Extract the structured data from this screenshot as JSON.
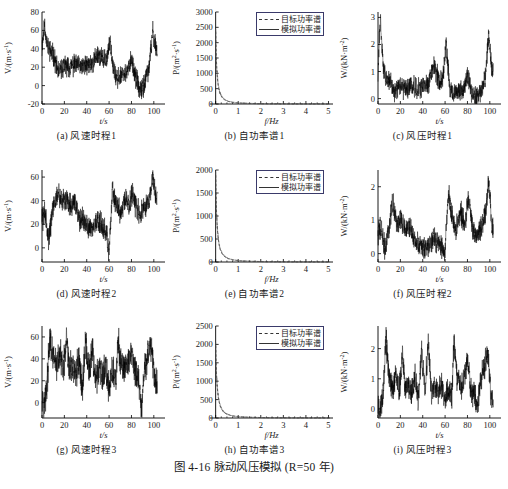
{
  "figure": {
    "caption": "图 4-16  脉动风压模拟 (R=50 年)",
    "caption_number": "图 4-16",
    "caption_title": "脉动风压模拟",
    "caption_note": "R=50 年"
  },
  "legend": {
    "target_label": "目标功率谱",
    "simulated_label": "模拟功率谱",
    "target_style": "dashed",
    "simulated_style": "solid",
    "border_color": "#3a3a6a"
  },
  "colors": {
    "line": "#000000",
    "axis": "#000000",
    "background": "#ffffff"
  },
  "chart_data": [
    {
      "id": "a",
      "type": "line",
      "title": "(a) 风速时程1",
      "xlabel": "t/s",
      "ylabel": "V/(m·s⁻¹)",
      "xlim": [
        0,
        110
      ],
      "ylim": [
        -20,
        80
      ],
      "xticks": [
        0,
        20,
        40,
        60,
        80,
        100
      ],
      "yticks": [
        -20,
        0,
        20,
        40,
        60,
        80
      ],
      "grid": false,
      "legend": false,
      "series": [
        {
          "name": "脉动风速1",
          "seed": 11,
          "mean": 26,
          "amp": 13,
          "noise": 9,
          "envelope": [
            [
              0,
              40
            ],
            [
              2,
              67
            ],
            [
              5,
              42
            ],
            [
              10,
              33
            ],
            [
              15,
              14
            ],
            [
              20,
              22
            ],
            [
              25,
              20
            ],
            [
              30,
              24
            ],
            [
              35,
              20
            ],
            [
              40,
              22
            ],
            [
              45,
              24
            ],
            [
              50,
              34
            ],
            [
              55,
              27
            ],
            [
              58,
              30
            ],
            [
              61,
              48
            ],
            [
              64,
              20
            ],
            [
              67,
              5
            ],
            [
              72,
              14
            ],
            [
              76,
              12
            ],
            [
              80,
              30
            ],
            [
              84,
              8
            ],
            [
              88,
              -8
            ],
            [
              92,
              4
            ],
            [
              96,
              22
            ],
            [
              99,
              58
            ],
            [
              102,
              40
            ]
          ]
        }
      ]
    },
    {
      "id": "b",
      "type": "line",
      "title": "(b) 自功率谱1",
      "xlabel": "f/Hz",
      "ylabel": "P/(m²·s⁻¹)",
      "xlim": [
        -0.25,
        5.2
      ],
      "ylim": [
        0,
        3000
      ],
      "xticks": [
        0,
        1,
        2,
        3,
        4,
        5
      ],
      "yticks": [
        0,
        500,
        1000,
        1500,
        2000,
        2500,
        3000
      ],
      "grid": false,
      "legend": true,
      "peak_value": 2550,
      "series": [
        {
          "name": "目标功率谱",
          "style": "dashed",
          "peak": 2550,
          "decay": 0.085
        },
        {
          "name": "模拟功率谱",
          "style": "solid",
          "peak": 2500,
          "decay": 0.09
        }
      ]
    },
    {
      "id": "c",
      "type": "line",
      "title": "(c) 风压时程1",
      "xlabel": "t/s",
      "ylabel": "W/(kN·m⁻²)",
      "xlim": [
        0,
        110
      ],
      "ylim": [
        -0.2,
        3.2
      ],
      "xticks": [
        0,
        20,
        40,
        60,
        80,
        100
      ],
      "yticks": [
        0,
        1,
        2,
        3
      ],
      "grid": false,
      "legend": false,
      "series": [
        {
          "name": "脉动风压1",
          "seed": 31,
          "mean": 0.55,
          "amp": 0.45,
          "noise": 0.3,
          "envelope": [
            [
              0,
              0.9
            ],
            [
              2,
              2.95
            ],
            [
              5,
              1.0
            ],
            [
              10,
              0.65
            ],
            [
              15,
              0.25
            ],
            [
              20,
              0.45
            ],
            [
              25,
              0.35
            ],
            [
              30,
              0.5
            ],
            [
              35,
              0.35
            ],
            [
              40,
              0.45
            ],
            [
              45,
              0.55
            ],
            [
              50,
              1.25
            ],
            [
              55,
              0.6
            ],
            [
              58,
              0.8
            ],
            [
              61,
              2.1
            ],
            [
              64,
              0.45
            ],
            [
              67,
              0.1
            ],
            [
              72,
              0.3
            ],
            [
              76,
              0.25
            ],
            [
              80,
              0.9
            ],
            [
              84,
              0.2
            ],
            [
              88,
              0.05
            ],
            [
              92,
              0.25
            ],
            [
              96,
              0.8
            ],
            [
              99,
              2.45
            ],
            [
              102,
              1.0
            ]
          ]
        }
      ]
    },
    {
      "id": "d",
      "type": "line",
      "title": "(d) 风速时程2",
      "xlabel": "t/s",
      "ylabel": "V/(m·s⁻¹)",
      "xlim": [
        0,
        110
      ],
      "ylim": [
        -12,
        66
      ],
      "xticks": [
        0,
        20,
        40,
        60,
        80,
        100
      ],
      "yticks": [
        0,
        20,
        40,
        60
      ],
      "grid": false,
      "legend": false,
      "series": [
        {
          "name": "脉动风速2",
          "seed": 57,
          "mean": 28,
          "amp": 11,
          "noise": 8,
          "envelope": [
            [
              0,
              24
            ],
            [
              3,
              30
            ],
            [
              6,
              6
            ],
            [
              10,
              35
            ],
            [
              14,
              46
            ],
            [
              18,
              38
            ],
            [
              22,
              42
            ],
            [
              26,
              36
            ],
            [
              30,
              38
            ],
            [
              34,
              24
            ],
            [
              38,
              22
            ],
            [
              42,
              18
            ],
            [
              46,
              17
            ],
            [
              50,
              24
            ],
            [
              54,
              18
            ],
            [
              58,
              12
            ],
            [
              60,
              -6
            ],
            [
              63,
              52
            ],
            [
              66,
              38
            ],
            [
              70,
              30
            ],
            [
              74,
              40
            ],
            [
              78,
              36
            ],
            [
              81,
              47
            ],
            [
              85,
              32
            ],
            [
              88,
              30
            ],
            [
              92,
              34
            ],
            [
              96,
              40
            ],
            [
              99,
              58
            ],
            [
              102,
              42
            ]
          ]
        }
      ]
    },
    {
      "id": "e",
      "type": "line",
      "title": "(e) 自功率谱2",
      "xlabel": "f/Hz",
      "ylabel": "P/(m²·s⁻¹)",
      "xlim": [
        -0.25,
        5.2
      ],
      "ylim": [
        0,
        2000
      ],
      "xticks": [
        0,
        1,
        2,
        3,
        4,
        5
      ],
      "yticks": [
        0,
        500,
        1000,
        1500,
        2000
      ],
      "grid": false,
      "legend": true,
      "peak_value": 2030,
      "series": [
        {
          "name": "目标功率谱",
          "style": "dashed",
          "peak": 2030,
          "decay": 0.09
        },
        {
          "name": "模拟功率谱",
          "style": "solid",
          "peak": 1980,
          "decay": 0.095
        }
      ]
    },
    {
      "id": "f",
      "type": "line",
      "title": "(f) 风压时程2",
      "xlabel": "t/s",
      "ylabel": "W/(kN·m⁻²)",
      "xlim": [
        0,
        110
      ],
      "ylim": [
        -0.25,
        2.5
      ],
      "xticks": [
        0,
        20,
        40,
        60,
        80,
        100
      ],
      "yticks": [
        0,
        1,
        2
      ],
      "grid": false,
      "legend": false,
      "series": [
        {
          "name": "脉动风压2",
          "seed": 73,
          "mean": 0.6,
          "amp": 0.4,
          "noise": 0.28,
          "envelope": [
            [
              0,
              0.6
            ],
            [
              3,
              0.8
            ],
            [
              6,
              0.1
            ],
            [
              10,
              0.75
            ],
            [
              13,
              1.55
            ],
            [
              17,
              0.85
            ],
            [
              21,
              1.0
            ],
            [
              25,
              0.7
            ],
            [
              29,
              0.75
            ],
            [
              33,
              0.35
            ],
            [
              37,
              0.3
            ],
            [
              41,
              0.18
            ],
            [
              45,
              0.2
            ],
            [
              49,
              0.45
            ],
            [
              53,
              0.35
            ],
            [
              57,
              0.25
            ],
            [
              60,
              0.05
            ],
            [
              63,
              1.9
            ],
            [
              66,
              1.1
            ],
            [
              70,
              0.7
            ],
            [
              74,
              1.2
            ],
            [
              78,
              0.95
            ],
            [
              81,
              1.75
            ],
            [
              85,
              0.65
            ],
            [
              88,
              0.55
            ],
            [
              92,
              0.75
            ],
            [
              96,
              1.1
            ],
            [
              99,
              2.2
            ],
            [
              102,
              0.8
            ]
          ]
        }
      ]
    },
    {
      "id": "g",
      "type": "line",
      "title": "(g) 风速时程3",
      "xlabel": "t/s",
      "ylabel": "V/(m·s⁻¹)",
      "xlim": [
        0,
        110
      ],
      "ylim": [
        -14,
        70
      ],
      "xticks": [
        0,
        20,
        40,
        60,
        80,
        100
      ],
      "yticks": [
        0,
        20,
        40,
        60
      ],
      "grid": false,
      "legend": false,
      "series": [
        {
          "name": "脉动风速3",
          "seed": 97,
          "mean": 30,
          "amp": 16,
          "noise": 12,
          "envelope": [
            [
              0,
              10
            ],
            [
              2,
              -4
            ],
            [
              5,
              24
            ],
            [
              7,
              58
            ],
            [
              10,
              40
            ],
            [
              13,
              34
            ],
            [
              16,
              44
            ],
            [
              19,
              28
            ],
            [
              22,
              56
            ],
            [
              24,
              30
            ],
            [
              27,
              34
            ],
            [
              30,
              26
            ],
            [
              33,
              40
            ],
            [
              36,
              12
            ],
            [
              39,
              56
            ],
            [
              42,
              26
            ],
            [
              45,
              48
            ],
            [
              48,
              20
            ],
            [
              51,
              32
            ],
            [
              54,
              22
            ],
            [
              57,
              34
            ],
            [
              60,
              12
            ],
            [
              63,
              30
            ],
            [
              66,
              20
            ],
            [
              68,
              54
            ],
            [
              71,
              34
            ],
            [
              74,
              30
            ],
            [
              77,
              36
            ],
            [
              80,
              48
            ],
            [
              83,
              28
            ],
            [
              86,
              24
            ],
            [
              89,
              -10
            ],
            [
              92,
              34
            ],
            [
              95,
              44
            ],
            [
              98,
              52
            ],
            [
              101,
              20
            ]
          ]
        }
      ]
    },
    {
      "id": "h",
      "type": "line",
      "title": "(h) 自功率谱3",
      "xlabel": "f/Hz",
      "ylabel": "P/(m²·s⁻¹)",
      "xlim": [
        -0.25,
        5.2
      ],
      "ylim": [
        0,
        2500
      ],
      "xticks": [
        0,
        1,
        2,
        3,
        4,
        5
      ],
      "yticks": [
        0,
        500,
        1000,
        1500,
        2000,
        2500
      ],
      "grid": false,
      "legend": true,
      "peak_value": 2100,
      "series": [
        {
          "name": "目标功率谱",
          "style": "dashed",
          "peak": 2100,
          "decay": 0.1
        },
        {
          "name": "模拟功率谱",
          "style": "solid",
          "peak": 2050,
          "decay": 0.105
        }
      ]
    },
    {
      "id": "i",
      "type": "line",
      "title": "(i) 风压时程3",
      "xlabel": "t/s",
      "ylabel": "W/(kN·m⁻²)",
      "xlim": [
        0,
        110
      ],
      "ylim": [
        -0.3,
        2.75
      ],
      "xticks": [
        0,
        20,
        40,
        60,
        80,
        100
      ],
      "yticks": [
        0,
        1,
        2
      ],
      "grid": false,
      "legend": false,
      "series": [
        {
          "name": "脉动风压3",
          "seed": 131,
          "mean": 0.75,
          "amp": 0.5,
          "noise": 0.35,
          "envelope": [
            [
              0,
              0.15
            ],
            [
              2,
              -0.05
            ],
            [
              5,
              0.6
            ],
            [
              7,
              2.45
            ],
            [
              10,
              1.0
            ],
            [
              13,
              0.7
            ],
            [
              16,
              1.1
            ],
            [
              19,
              0.55
            ],
            [
              22,
              1.85
            ],
            [
              24,
              0.7
            ],
            [
              27,
              0.8
            ],
            [
              30,
              0.55
            ],
            [
              33,
              1.1
            ],
            [
              36,
              0.2
            ],
            [
              39,
              2.0
            ],
            [
              42,
              0.55
            ],
            [
              45,
              2.25
            ],
            [
              48,
              0.4
            ],
            [
              51,
              0.85
            ],
            [
              54,
              0.45
            ],
            [
              57,
              0.9
            ],
            [
              60,
              0.25
            ],
            [
              63,
              0.7
            ],
            [
              66,
              0.4
            ],
            [
              68,
              2.3
            ],
            [
              71,
              0.9
            ],
            [
              74,
              0.75
            ],
            [
              77,
              1.0
            ],
            [
              80,
              1.7
            ],
            [
              83,
              0.6
            ],
            [
              86,
              0.5
            ],
            [
              89,
              0.05
            ],
            [
              92,
              0.95
            ],
            [
              95,
              1.35
            ],
            [
              98,
              1.9
            ],
            [
              101,
              0.35
            ]
          ]
        }
      ]
    }
  ]
}
